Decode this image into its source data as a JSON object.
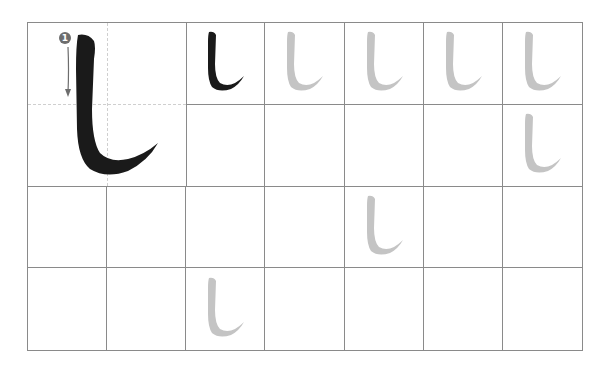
{
  "worksheet": {
    "character": "し",
    "stroke_order": [
      {
        "number": "1",
        "direction": "down"
      }
    ],
    "grid": {
      "columns": 7,
      "rows": 4
    },
    "colors": {
      "model": "#1a1a1a",
      "trace": "#c4c4c4",
      "grid_line": "#8a8a8a",
      "guide_line": "#cfcfcf",
      "stroke_badge": "#6d6d6d"
    },
    "model_cells": [
      {
        "row": 0,
        "col": 2,
        "style": "model"
      }
    ],
    "trace_cells": [
      {
        "row": 0,
        "col": 3
      },
      {
        "row": 0,
        "col": 4
      },
      {
        "row": 0,
        "col": 5
      },
      {
        "row": 0,
        "col": 6
      },
      {
        "row": 1,
        "col": 6
      },
      {
        "row": 2,
        "col": 4
      },
      {
        "row": 3,
        "col": 2
      }
    ]
  }
}
